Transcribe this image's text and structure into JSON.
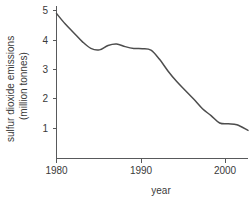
{
  "chart_data": {
    "type": "line",
    "title": "",
    "xlabel": "year",
    "ylabel": "sulfur dioxide emissions (million tonnes)",
    "ylabel_line1": "sulfur dioxide emissions",
    "ylabel_line2": "(million tonnes)",
    "xlim": [
      1980,
      2002.3
    ],
    "ylim": [
      0,
      5.2
    ],
    "grid": false,
    "legend": false,
    "line_color": "#4d4d4d",
    "axis_color": "#58595b",
    "background": "#ffffff",
    "xticks": [
      1980,
      1990,
      2000
    ],
    "xtick_labels": [
      "1980",
      "1990",
      "2000"
    ],
    "yticks": [
      1,
      2,
      3,
      4,
      5
    ],
    "ytick_labels": [
      "1",
      "2",
      "3",
      "4",
      "5"
    ],
    "x": [
      1980,
      1981,
      1982,
      1983,
      1984,
      1985,
      1986,
      1987,
      1988,
      1989,
      1990,
      1991,
      1992,
      1993,
      1994,
      1995,
      1996,
      1997,
      1998,
      1999,
      2000,
      2001,
      2002.3
    ],
    "values": [
      4.9,
      4.55,
      4.25,
      3.95,
      3.72,
      3.67,
      3.82,
      3.87,
      3.78,
      3.72,
      3.71,
      3.66,
      3.35,
      2.95,
      2.6,
      2.3,
      2.0,
      1.68,
      1.45,
      1.2,
      1.17,
      1.14,
      0.95
    ],
    "series": [
      {
        "name": "sulfur dioxide emissions",
        "values": [
          4.9,
          4.55,
          4.25,
          3.95,
          3.72,
          3.67,
          3.82,
          3.87,
          3.78,
          3.72,
          3.71,
          3.66,
          3.35,
          2.95,
          2.6,
          2.3,
          2.0,
          1.68,
          1.45,
          1.2,
          1.17,
          1.14,
          0.95
        ]
      }
    ]
  }
}
